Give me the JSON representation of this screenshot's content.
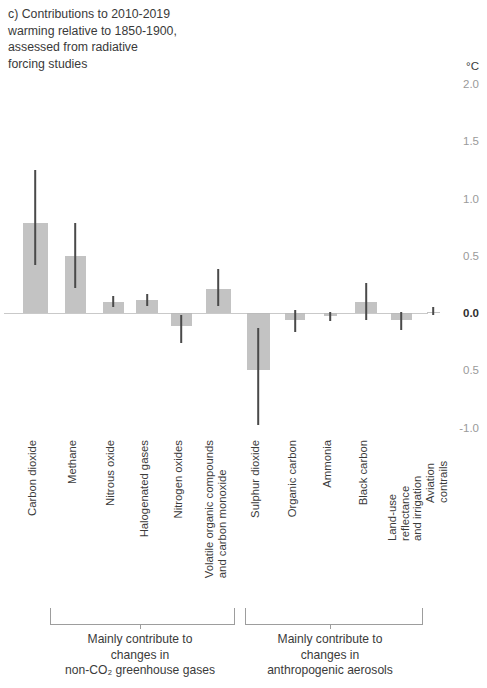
{
  "panel": {
    "title": "c) Contributions to 2010-2019\nwarming relative to 1850-1900,\nassessed from radiative\nforcing studies"
  },
  "axis": {
    "unit": "°C",
    "ticks": [
      "2.0",
      "1.5",
      "1.0",
      "0.5",
      "0.0",
      "0.5",
      "-1.0"
    ]
  },
  "brackets": {
    "left": {
      "caption": "Mainly contribute to\nchanges in\nnon-CO₂ greenhouse gases"
    },
    "right": {
      "caption": "Mainly contribute to\nchanges in\nanthropogenic aerosols"
    }
  },
  "chart_data": {
    "type": "bar",
    "title": "c) Contributions to 2010-2019 warming relative to 1850-1900, assessed from radiative forcing studies",
    "xlabel": "",
    "ylabel": "°C",
    "ylim": [
      -1.0,
      2.0
    ],
    "yticks": [
      2.0,
      1.5,
      1.0,
      0.5,
      0.0,
      -0.5,
      -1.0
    ],
    "ytick_labels": [
      "2.0",
      "1.5",
      "1.0",
      "0.5",
      "0.0",
      "0.5",
      "-1.0"
    ],
    "grid": false,
    "legend": "none",
    "zero_line": 0.0,
    "categories": [
      "Carbon dioxide",
      "Methane",
      "Nitrous oxide",
      "Halogenated gases",
      "Nitrogen oxides",
      "Volatile organic compounds and carbon monoxide",
      "Sulphur dioxide",
      "Organic carbon",
      "Ammonia",
      "Black carbon",
      "Land-use reflectance and irrigation",
      "Aviation contrails"
    ],
    "category_labels_wrapped": [
      "Carbon dioxide",
      "Methane",
      "Nitrous oxide",
      "Halogenated gases",
      "Nitrogen oxides",
      "Volatile organic compounds\nand carbon monoxide",
      "Sulphur dioxide",
      "Organic carbon",
      "Ammonia",
      "Black carbon",
      "Land-use reflectance\nand irrigation",
      "Aviation contrails"
    ],
    "values": [
      0.79,
      0.5,
      0.1,
      0.11,
      -0.11,
      0.21,
      -0.5,
      -0.06,
      -0.03,
      0.1,
      -0.06,
      0.01
    ],
    "err_low": [
      0.42,
      0.22,
      0.05,
      0.06,
      -0.26,
      0.06,
      -0.98,
      -0.17,
      -0.07,
      -0.06,
      -0.15,
      -0.02
    ],
    "err_high": [
      1.25,
      0.79,
      0.15,
      0.17,
      -0.02,
      0.38,
      -0.13,
      0.03,
      0.01,
      0.26,
      0.01,
      0.05
    ],
    "groups": [
      {
        "name": "Mainly contribute to changes in non-CO₂ greenhouse gases",
        "members": [
          "Methane",
          "Nitrous oxide",
          "Halogenated gases",
          "Nitrogen oxides",
          "Volatile organic compounds and carbon monoxide"
        ]
      },
      {
        "name": "Mainly contribute to changes in anthropogenic aerosols",
        "members": [
          "Sulphur dioxide",
          "Organic carbon",
          "Ammonia",
          "Black carbon",
          "Land-use reflectance and irrigation",
          "Aviation contrails"
        ]
      }
    ],
    "colors": {
      "bar": "#b9b9b9",
      "error": "#4a4a4a",
      "zero_line": "#c9c9c9",
      "text": "#3a3a3a",
      "tick_text": "#9a9a9a"
    }
  },
  "layout": {
    "bar_centers": [
      35,
      75,
      113,
      147,
      181,
      218,
      258,
      295,
      330,
      366,
      401,
      433
    ],
    "bar_widths": [
      25,
      21,
      21,
      22,
      21,
      25,
      23,
      20,
      13,
      22,
      21,
      13
    ],
    "label_x": [
      26,
      66,
      104,
      138,
      172,
      203,
      249,
      286,
      321,
      357,
      386,
      424
    ],
    "zero_y_px": 253,
    "px_per_unit": 114.5,
    "bracket_left": {
      "x": 50,
      "w": 183,
      "tick": 140
    },
    "bracket_right": {
      "x": 245,
      "w": 176,
      "tick": 330
    }
  }
}
